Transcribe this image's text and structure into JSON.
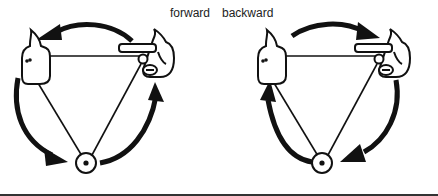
{
  "labels": {
    "forward": "forward",
    "backward": "backward"
  },
  "diagrams": [
    {
      "id": "forward",
      "direction": "clockwise-from-right-to-left-hand",
      "nodes": [
        "left-hand-fist",
        "right-hand-pointing",
        "bottom-circled-dot"
      ],
      "arrows": [
        {
          "from": "right-hand-pointing",
          "to": "left-hand-fist"
        },
        {
          "from": "left-hand-fist",
          "to": "bottom-circled-dot"
        },
        {
          "from": "bottom-circled-dot",
          "to": "right-hand-pointing"
        }
      ]
    },
    {
      "id": "backward",
      "direction": "counterclockwise",
      "nodes": [
        "left-hand-fist",
        "right-hand-pointing",
        "bottom-circled-dot"
      ],
      "arrows": [
        {
          "from": "left-hand-fist",
          "to": "right-hand-pointing"
        },
        {
          "from": "right-hand-pointing",
          "to": "bottom-circled-dot"
        },
        {
          "from": "bottom-circled-dot",
          "to": "left-hand-fist"
        }
      ]
    }
  ],
  "colors": {
    "ink": "#111111",
    "background": "#ffffff"
  }
}
